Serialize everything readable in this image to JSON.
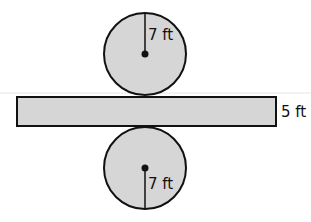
{
  "figure": {
    "type": "cylinder-net",
    "top_circle": {
      "radius_label": "7 ft"
    },
    "rectangle": {
      "height_label": "5 ft"
    },
    "bottom_circle": {
      "radius_label": "7 ft"
    },
    "colors": {
      "fill": "#d6d6d6",
      "stroke": "#111111"
    }
  }
}
